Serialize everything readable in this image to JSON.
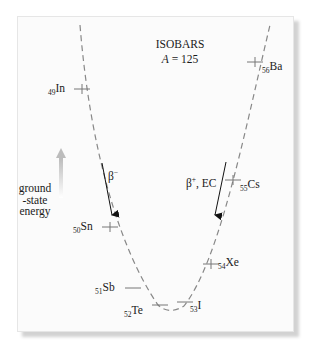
{
  "diagram": {
    "title": "ISOBARS",
    "subtitle_var": "A",
    "subtitle_value": " = 125",
    "axis_label": [
      "ground",
      "-state",
      "energy"
    ],
    "decays": {
      "left": {
        "symbol": "β",
        "charge": "−"
      },
      "right": {
        "symbol": "β",
        "charge": "+",
        "suffix": ", EC"
      }
    },
    "nuclides": [
      {
        "z": "49",
        "symbol": "In"
      },
      {
        "z": "50",
        "symbol": "Sn"
      },
      {
        "z": "51",
        "symbol": "Sb"
      },
      {
        "z": "52",
        "symbol": "Te"
      },
      {
        "z": "53",
        "symbol": "I"
      },
      {
        "z": "54",
        "symbol": "Xe"
      },
      {
        "z": "55",
        "symbol": "Cs"
      },
      {
        "z": "56",
        "symbol": "Ba"
      }
    ],
    "colors": {
      "curve": "#888888",
      "text": "#1a1a1a",
      "energy_arrow": "#c8c8c8",
      "panel": "#fbfbfb"
    }
  }
}
